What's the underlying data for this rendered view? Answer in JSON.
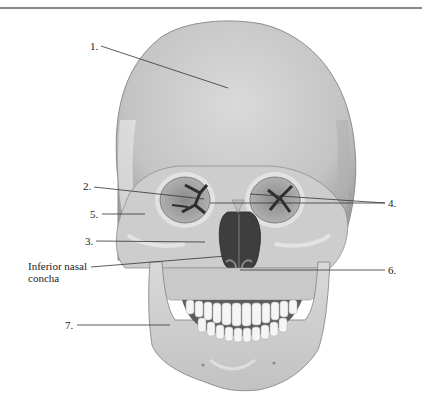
{
  "figure": {
    "colors": {
      "bone": "#cfcfcf",
      "bone_light": "#e4e4e4",
      "bone_shadow": "#9c9c9c",
      "cavity": "#4a4a4a",
      "teeth": "#f4f4f4",
      "leader_line": "#333333",
      "rule": "#8a8a8a"
    }
  },
  "labels": [
    {
      "id": "1",
      "text": "1."
    },
    {
      "id": "2",
      "text": "2."
    },
    {
      "id": "5",
      "text": "5."
    },
    {
      "id": "3",
      "text": "3."
    },
    {
      "id": "inferior-nasal-concha",
      "text": "Inferior nasal concha"
    },
    {
      "id": "4",
      "text": "4."
    },
    {
      "id": "6",
      "text": "6."
    },
    {
      "id": "7",
      "text": "7."
    }
  ]
}
